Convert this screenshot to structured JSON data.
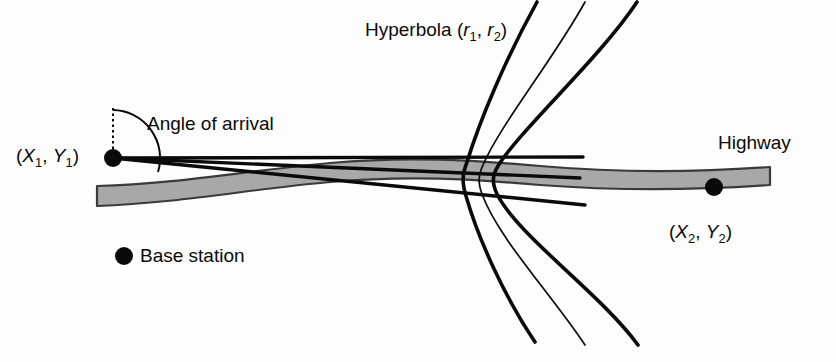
{
  "figure": {
    "background_color": "#fdfdfd",
    "ink_color": "#0a0a0a",
    "highway_fill": "#a8a8a8",
    "highway_stroke": "#3a3a3a"
  },
  "labels": {
    "hyperbola": "Hyperbola (r1, r2)",
    "hyperbola_parts": {
      "name": "Hyperbola",
      "open_paren": "(",
      "r": "r",
      "sub1": "1",
      "comma": ", ",
      "sub2": "2",
      "close_paren": ")"
    },
    "angle_of_arrival": "Angle of arrival",
    "coord_1": "(X1, Y1)",
    "coord_1_parts": {
      "open_paren": "(",
      "x": "X",
      "x_sub": "1",
      "comma": ", ",
      "y": "Y",
      "y_sub": "1",
      "close_paren": ")"
    },
    "coord_2": "(X2, Y2)",
    "coord_2_parts": {
      "open_paren": "(",
      "x": "X",
      "x_sub": "2",
      "comma": ", ",
      "y": "Y",
      "y_sub": "2",
      "close_paren": ")"
    },
    "highway": "Highway",
    "legend_base_station": "Base station"
  },
  "diagram_elements": {
    "base_station_1": {
      "cx": 113,
      "cy": 158,
      "r": 9
    },
    "base_station_2": {
      "cx": 714,
      "cy": 187,
      "r": 9
    },
    "legend_marker": {
      "cx": 124,
      "cy": 256,
      "r": 9
    },
    "angle_reference_line": {
      "x": 113,
      "y_top": 108,
      "y_bottom": 156,
      "style": "dotted"
    },
    "angle_arc_radius": 48,
    "aoa_lines_count": 3,
    "hyperbola_branches_count": 3
  }
}
